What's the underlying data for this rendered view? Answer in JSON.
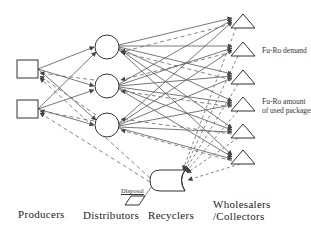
{
  "diagram": {
    "type": "supply-chain-network",
    "stages": [
      {
        "id": "producers",
        "label": "Producers",
        "shape": "square",
        "count": 2
      },
      {
        "id": "distributors",
        "label": "Distributors",
        "shape": "circle",
        "count": 3
      },
      {
        "id": "recyclers",
        "label": "Recyclers",
        "shape": "rounded-cylinder",
        "count": 1
      },
      {
        "id": "wholesalers",
        "label_line1": "Wholesalers",
        "label_line2": "/Collectors",
        "shape": "triangle",
        "count": 6
      }
    ],
    "annotations": {
      "demand": "Fu-Ro demand",
      "used_line1": "Fu-Ro amount",
      "used_line2": "of used packages",
      "disposal": "Disposal"
    },
    "legend_semantics": {
      "solid_lines": "forward flow (products)",
      "dashed_lines": "reverse flow (used packages)"
    },
    "colors": {
      "line": "#4a4a4a",
      "text": "#222222",
      "background": "#ffffff"
    }
  }
}
